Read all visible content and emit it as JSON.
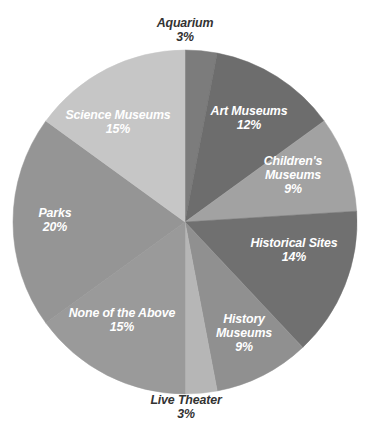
{
  "chart_data": {
    "type": "pie",
    "title": "",
    "subtitle": "",
    "xlabel": "",
    "ylabel": "",
    "legend": "none",
    "grid": false,
    "value_suffix": "%",
    "total": 100,
    "start_angle_deg": 0,
    "direction": "clockwise",
    "categories": [
      "Aquarium",
      "Art Museums",
      "Children's Museums",
      "Historical Sites",
      "History Museums",
      "Live Theater",
      "None of the Above",
      "Parks",
      "Science Museums"
    ],
    "values": [
      3,
      12,
      9,
      14,
      9,
      3,
      15,
      20,
      15
    ],
    "slices": [
      {
        "name": "Aquarium",
        "value": 3,
        "value_label": "3%",
        "color": "#7c7c7c",
        "label_position": "outside",
        "label_lines": [
          "Aquarium",
          "3%"
        ]
      },
      {
        "name": "Art Museums",
        "value": 12,
        "value_label": "12%",
        "color": "#6d6d6d",
        "label_position": "inside",
        "label_lines": [
          "Art Museums",
          "12%"
        ]
      },
      {
        "name": "Children's Museums",
        "value": 9,
        "value_label": "9%",
        "color": "#a2a2a2",
        "label_position": "inside",
        "label_lines": [
          "Children's",
          "Museums",
          "9%"
        ]
      },
      {
        "name": "Historical Sites",
        "value": 14,
        "value_label": "14%",
        "color": "#707070",
        "label_position": "inside",
        "label_lines": [
          "Historical Sites",
          "14%"
        ]
      },
      {
        "name": "History Museums",
        "value": 9,
        "value_label": "9%",
        "color": "#909090",
        "label_position": "inside",
        "label_lines": [
          "History",
          "Museums",
          "9%"
        ]
      },
      {
        "name": "Live Theater",
        "value": 3,
        "value_label": "3%",
        "color": "#b6b6b6",
        "label_position": "outside",
        "label_lines": [
          "Live Theater",
          "3%"
        ]
      },
      {
        "name": "None of the Above",
        "value": 15,
        "value_label": "15%",
        "color": "#9a9a9a",
        "label_position": "inside",
        "label_lines": [
          "None of the Above",
          "15%"
        ]
      },
      {
        "name": "Parks",
        "value": 20,
        "value_label": "20%",
        "color": "#959595",
        "label_position": "inside",
        "label_lines": [
          "Parks",
          "20%"
        ]
      },
      {
        "name": "Science Museums",
        "value": 15,
        "value_label": "15%",
        "color": "#c6c6c6",
        "label_position": "inside",
        "label_lines": [
          "Science Museums",
          "15%"
        ]
      }
    ],
    "geometry": {
      "center_x": 185,
      "center_y": 222,
      "radius": 172
    },
    "colors": {
      "background": "#ffffff",
      "inside_label": "#ffffff",
      "outside_label": "#333333"
    }
  },
  "labels": {
    "aquarium": {
      "name": "Aquarium",
      "value": "3%"
    },
    "art_museums": {
      "name": "Art Museums",
      "value": "12%"
    },
    "childrens_museums": {
      "name_line1": "Children's",
      "name_line2": "Museums",
      "value": "9%"
    },
    "historical_sites": {
      "name": "Historical Sites",
      "value": "14%"
    },
    "history_museums": {
      "name_line1": "History",
      "name_line2": "Museums",
      "value": "9%"
    },
    "live_theater": {
      "name": "Live Theater",
      "value": "3%"
    },
    "none_of_the_above": {
      "name": "None of the Above",
      "value": "15%"
    },
    "parks": {
      "name": "Parks",
      "value": "20%"
    },
    "science_museums": {
      "name": "Science Museums",
      "value": "15%"
    }
  }
}
